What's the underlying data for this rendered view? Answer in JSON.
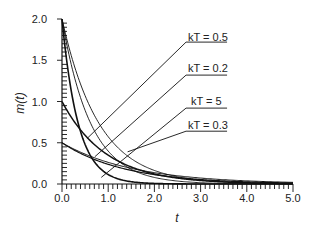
{
  "chart_data": {
    "type": "line",
    "title": "",
    "xlabel": "t",
    "ylabel": "m(t)",
    "xlim": [
      0.0,
      5.0
    ],
    "ylim": [
      0.0,
      2.0
    ],
    "x_ticks": [
      "0.0",
      "1.0",
      "2.0",
      "3.0",
      "4.0",
      "5.0"
    ],
    "y_ticks": [
      "0.0",
      "0.5",
      "1.0",
      "1.5",
      "2.0"
    ],
    "grid": false,
    "legend": "none",
    "series": [
      {
        "name": "m0=2.0, fast (thick)",
        "m0": 2.0,
        "tau": 0.35,
        "width": 1.6
      },
      {
        "name": "m0=2.0, slow A",
        "m0": 2.0,
        "tau": 0.62,
        "width": 0.9
      },
      {
        "name": "m0=2.0, slow B",
        "m0": 2.0,
        "tau": 0.8,
        "width": 0.9
      },
      {
        "name": "m0=1.0 (thick)",
        "m0": 1.0,
        "tau": 0.95,
        "width": 1.5
      },
      {
        "name": "m0=0.5, A",
        "m0": 0.5,
        "tau": 1.35,
        "width": 1.2
      },
      {
        "name": "m0=0.5, B",
        "m0": 0.5,
        "tau": 1.55,
        "width": 1.0
      }
    ],
    "annotations": [
      {
        "text": "kT = 0.5",
        "label_x": 2.75,
        "label_y": 1.72,
        "target_x": 0.54,
        "target_y": 0.55
      },
      {
        "text": "kT = 0.2",
        "label_x": 2.75,
        "label_y": 1.32,
        "target_x": 0.71,
        "target_y": 0.33
      },
      {
        "text": "kT = 5",
        "label_x": 2.75,
        "label_y": 0.92,
        "target_x": 0.85,
        "target_y": 0.08
      },
      {
        "text": "kT = 0.3",
        "label_x": 2.75,
        "label_y": 0.64,
        "target_x": 1.42,
        "target_y": 0.39
      }
    ]
  },
  "axes": {
    "y_tick_labels": [
      "0.0",
      "0.5",
      "1.0",
      "1.5",
      "2.0"
    ],
    "x_tick_labels": [
      "0.0",
      "1.0",
      "2.0",
      "3.0",
      "4.0",
      "5.0"
    ],
    "xlabel": "t",
    "ylabel": "m(t)"
  },
  "annotations": {
    "a0": "kT = 0.5",
    "a1": "kT = 0.2",
    "a2": "kT = 5",
    "a3": "kT = 0.3"
  }
}
